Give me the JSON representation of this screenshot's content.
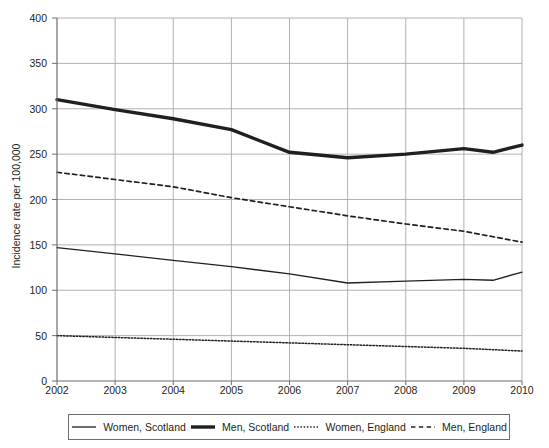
{
  "chart_data": {
    "type": "line",
    "title": "",
    "xlabel": "",
    "ylabel": "Incidence rate per 100,000",
    "x": [
      2002,
      2003,
      2004,
      2005,
      2006,
      2007,
      2008,
      2009,
      2010
    ],
    "xlim": [
      2002,
      2010
    ],
    "ylim": [
      0,
      400
    ],
    "xticks": [
      "2002",
      "2003",
      "2004",
      "2005",
      "2006",
      "2007",
      "2008",
      "2009",
      "2010"
    ],
    "yticks": [
      "0",
      "50",
      "100",
      "150",
      "200",
      "250",
      "300",
      "350",
      "400"
    ],
    "ytick_values": [
      0,
      50,
      100,
      150,
      200,
      250,
      300,
      350,
      400
    ],
    "grid": true,
    "legend_position": "bottom",
    "series": [
      {
        "name": "Women, Scotland",
        "style": "solid-thin",
        "color": "#231f20",
        "width": 1.3,
        "values": [
          147,
          140,
          133,
          126,
          118,
          108,
          110,
          112,
          120
        ],
        "extra_points": [
          {
            "x": 2009.5,
            "y": 111
          }
        ]
      },
      {
        "name": "Men, Scotland",
        "style": "solid-thick",
        "color": "#231f20",
        "width": 3.4,
        "values": [
          310,
          299,
          289,
          277,
          252,
          246,
          250,
          256,
          260
        ],
        "extra_points": [
          {
            "x": 2009.5,
            "y": 252
          }
        ]
      },
      {
        "name": "Women, England",
        "style": "dotted",
        "color": "#231f20",
        "width": 1.5,
        "values": [
          50,
          48,
          46,
          44,
          42,
          40,
          38,
          36,
          33
        ]
      },
      {
        "name": "Men, England",
        "style": "dashed",
        "color": "#231f20",
        "width": 1.7,
        "values": [
          230,
          222,
          214,
          202,
          192,
          182,
          173,
          165,
          153
        ]
      }
    ]
  },
  "axes": {
    "y_title": "Incidence rate per 100,000"
  },
  "legend": {
    "items": [
      {
        "label": "Women, Scotland",
        "style": "solid-thin"
      },
      {
        "label": "Men, Scotland",
        "style": "solid-thick"
      },
      {
        "label": "Women, England",
        "style": "dotted"
      },
      {
        "label": "Men, England",
        "style": "dashed"
      }
    ]
  },
  "colors": {
    "ink": "#231f20",
    "grid": "#a7a9ac",
    "axis": "#6d6e71",
    "background": "#ffffff"
  }
}
